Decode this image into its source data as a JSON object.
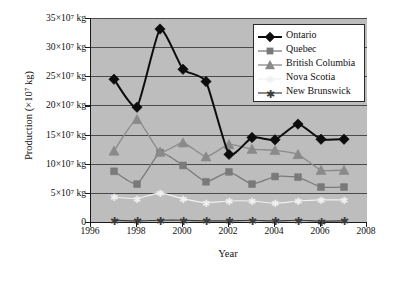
{
  "chart_data": {
    "type": "line",
    "title": "",
    "xlabel": "Year",
    "ylabel": "Production (×10⁷ kg)",
    "xlim": [
      1996,
      2008
    ],
    "ylim": [
      0,
      35
    ],
    "grid": true,
    "legend_position": "top-right",
    "x": [
      1997,
      1998,
      1999,
      2000,
      2001,
      2002,
      2003,
      2004,
      2005,
      2006,
      2007
    ],
    "x_tick_labels": [
      "1996",
      "1998",
      "2000",
      "2002",
      "2004",
      "2006",
      "2008"
    ],
    "x_ticks": [
      1996,
      1998,
      2000,
      2002,
      2004,
      2006,
      2008
    ],
    "y_tick_labels": [
      "35×10⁷ kg",
      "30×10⁷ kg",
      "25×10⁷ kg",
      "20×10⁷ kg",
      "15×10⁷ kg",
      "10×10⁷ kg",
      "5×10⁷ kg",
      "0"
    ],
    "y_ticks": [
      35,
      30,
      25,
      20,
      15,
      10,
      5,
      0
    ],
    "series": [
      {
        "name": "Ontario",
        "color": "#0d0d0d",
        "marker": "diamond",
        "line_width": 2.0,
        "marker_size": 5.2,
        "values": [
          24.5,
          19.7,
          33.1,
          26.2,
          24.1,
          11.6,
          14.5,
          14.1,
          16.8,
          14.2,
          14.2
        ]
      },
      {
        "name": "Quebec",
        "color": "#7a7a7a",
        "marker": "square",
        "line_width": 1.3,
        "marker_size": 3.4,
        "values": [
          8.7,
          6.5,
          11.9,
          9.7,
          6.9,
          8.6,
          6.5,
          7.8,
          7.7,
          6.0,
          6.0
        ]
      },
      {
        "name": "British Columbia",
        "color": "#8a8a8a",
        "marker": "triangle",
        "line_width": 1.3,
        "marker_size": 5.0,
        "values": [
          12.2,
          17.6,
          12.0,
          13.6,
          11.2,
          13.3,
          12.5,
          12.3,
          11.6,
          8.9,
          8.9
        ]
      },
      {
        "name": "Nova Scotia",
        "color": "#f0f0f0",
        "marker": "star",
        "line_width": 1.2,
        "marker_size": 3.2,
        "values": [
          4.3,
          4.0,
          5.0,
          4.0,
          3.3,
          3.6,
          3.6,
          3.2,
          3.6,
          3.8,
          3.8
        ]
      },
      {
        "name": "New Brunswick",
        "color": "#3c3c3c",
        "marker": "star",
        "line_width": 1.2,
        "marker_size": 3.6,
        "values": [
          0.3,
          0.2,
          0.3,
          0.3,
          0.2,
          0.2,
          0.3,
          0.2,
          0.3,
          0.15,
          0.2
        ]
      }
    ]
  },
  "style": {
    "plot_background": "#bdbdbd",
    "page_background": "#ffffff",
    "gridline_color": "#4a4a4a",
    "axis_color": "#1a1a1a"
  }
}
